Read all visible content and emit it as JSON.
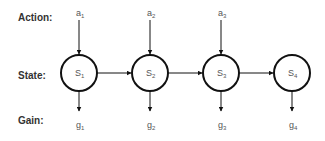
{
  "row_labels": {
    "action": "Action:",
    "state": "State:",
    "gain": "Gain:"
  },
  "nodes": [
    {
      "state": "S",
      "state_sub": "1",
      "action": "a",
      "action_sub": "1",
      "gain": "g",
      "gain_sub": "1"
    },
    {
      "state": "S",
      "state_sub": "2",
      "action": "a",
      "action_sub": "2",
      "gain": "g",
      "gain_sub": "2"
    },
    {
      "state": "S",
      "state_sub": "3",
      "action": "a",
      "action_sub": "3",
      "gain": "g",
      "gain_sub": "3"
    },
    {
      "state": "S",
      "state_sub": "4",
      "action": null,
      "action_sub": null,
      "gain": "g",
      "gain_sub": "4"
    }
  ],
  "colors": {
    "stroke": "#111111",
    "text": "#555555",
    "label": "#333333"
  }
}
